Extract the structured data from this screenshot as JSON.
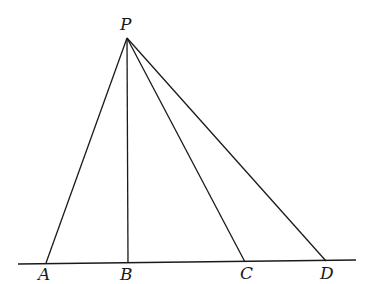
{
  "diagram": {
    "type": "geometry",
    "points": {
      "P": {
        "label": "P",
        "x": 127,
        "y": 38
      },
      "A": {
        "label": "A",
        "x": 46,
        "y": 263
      },
      "B": {
        "label": "B",
        "x": 128,
        "y": 263
      },
      "C": {
        "label": "C",
        "x": 245,
        "y": 262
      },
      "D": {
        "label": "D",
        "x": 326,
        "y": 261
      }
    },
    "baseline": {
      "x1": 18,
      "y1": 264,
      "x2": 356,
      "y2": 260
    },
    "segments": [
      "PA",
      "PB",
      "PC",
      "PD"
    ],
    "stroke_color": "#1a1a1a"
  }
}
